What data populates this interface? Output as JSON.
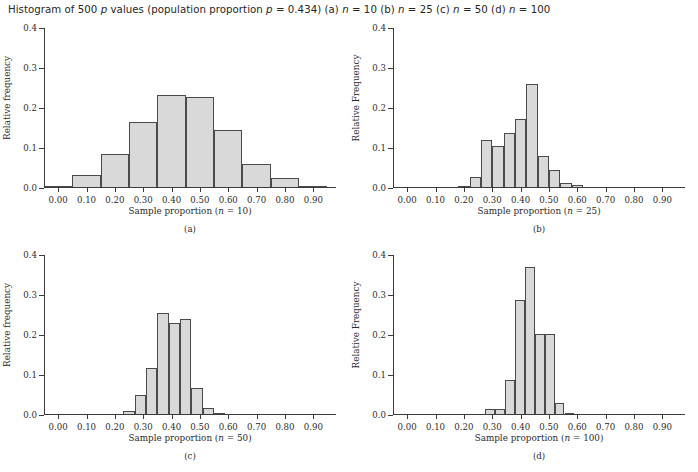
{
  "caption": {
    "prefix": "Histogram of 500 ",
    "phat": "p",
    "middle": " values (population proportion ",
    "p_sym": "p",
    "p_val": " = 0.434) (a) ",
    "n_a_sym": "n",
    "n_a": " = 10 (b) ",
    "n_b_sym": "n",
    "n_b": " = 25 (c) ",
    "n_c_sym": "n",
    "n_c": " = 50 (d) ",
    "n_d_sym": "n",
    "n_d": " = 100"
  },
  "style": {
    "bar_fill": "#d9d9d9",
    "bar_stroke": "#4a4a4a",
    "axis_color": "#3b3b3b",
    "text_color": "#2b2b2b",
    "background": "#ffffff"
  },
  "shared": {
    "x_ticks": [
      0.0,
      0.1,
      0.2,
      0.3,
      0.4,
      0.5,
      0.6,
      0.7,
      0.8,
      0.9
    ],
    "x_tick_labels": [
      "0.00",
      "0.10",
      "0.20",
      "0.30",
      "0.40",
      "0.50",
      "0.60",
      "0.70",
      "0.80",
      "0.90"
    ],
    "y_ticks": [
      0.0,
      0.1,
      0.2,
      0.3,
      0.4
    ],
    "y_tick_labels": [
      "0.0",
      "0.1",
      "0.2",
      "0.3",
      "0.4"
    ],
    "xlim": [
      -0.05,
      0.98
    ],
    "ylim": [
      0.0,
      0.4
    ],
    "xlabel_prefix": "Sample proportion (",
    "xlabel_n_sym": "n",
    "xlabel_suffix": ")"
  },
  "chart_data": [
    {
      "id": "a",
      "type": "bar",
      "subcaption": "(a)",
      "title": "",
      "xlabel": "Sample proportion (n = 10)",
      "xlabel_n_value": " = 10",
      "ylabel": "Relative frequency",
      "sample_size": 10,
      "xlim": [
        -0.05,
        0.98
      ],
      "ylim": [
        0.0,
        0.4
      ],
      "grid": false,
      "bin_width": 0.1,
      "bin_edges": [
        -0.05,
        0.05,
        0.15,
        0.25,
        0.35,
        0.45,
        0.55,
        0.65,
        0.75,
        0.85,
        0.95
      ],
      "centers": [
        0.0,
        0.1,
        0.2,
        0.3,
        0.4,
        0.5,
        0.6,
        0.7,
        0.8,
        0.9
      ],
      "values": [
        0.002,
        0.033,
        0.086,
        0.165,
        0.232,
        0.228,
        0.146,
        0.059,
        0.026,
        0.002
      ]
    },
    {
      "id": "b",
      "type": "bar",
      "subcaption": "(b)",
      "title": "",
      "xlabel": "Sample proportion (n = 25)",
      "xlabel_n_value": " = 25",
      "ylabel": "Relative Frequency",
      "sample_size": 25,
      "xlim": [
        -0.05,
        0.98
      ],
      "ylim": [
        0.0,
        0.4
      ],
      "grid": false,
      "bin_width": 0.04,
      "bin_edges": [
        0.18,
        0.22,
        0.26,
        0.3,
        0.34,
        0.38,
        0.42,
        0.46,
        0.5,
        0.54,
        0.58,
        0.62,
        0.66,
        0.7
      ],
      "centers": [
        0.2,
        0.24,
        0.28,
        0.32,
        0.36,
        0.4,
        0.44,
        0.48,
        0.52,
        0.56,
        0.6,
        0.64,
        0.68
      ],
      "values": [
        0.005,
        0.028,
        0.119,
        0.106,
        0.137,
        0.172,
        0.261,
        0.079,
        0.044,
        0.013,
        0.008,
        0.0,
        0.0
      ]
    },
    {
      "id": "c",
      "type": "bar",
      "subcaption": "(c)",
      "title": "",
      "xlabel": "Sample proportion (n = 50)",
      "xlabel_n_value": " = 50",
      "ylabel": "Relative frequency",
      "sample_size": 50,
      "xlim": [
        -0.05,
        0.98
      ],
      "ylim": [
        0.0,
        0.4
      ],
      "grid": false,
      "bin_width": 0.04,
      "bin_edges": [
        0.23,
        0.27,
        0.31,
        0.35,
        0.39,
        0.43,
        0.47,
        0.51,
        0.55,
        0.59,
        0.63
      ],
      "centers": [
        0.25,
        0.29,
        0.33,
        0.37,
        0.41,
        0.45,
        0.49,
        0.53,
        0.57,
        0.61
      ],
      "values": [
        0.01,
        0.049,
        0.118,
        0.254,
        0.231,
        0.241,
        0.067,
        0.018,
        0.003,
        0.0
      ]
    },
    {
      "id": "d",
      "type": "bar",
      "subcaption": "(d)",
      "title": "",
      "xlabel": "Sample proportion (n = 100)",
      "xlabel_n_value": " = 100",
      "ylabel": "Relative Frequency",
      "sample_size": 100,
      "xlim": [
        -0.05,
        0.98
      ],
      "ylim": [
        0.0,
        0.4
      ],
      "grid": false,
      "bin_width": 0.035,
      "bin_edges": [
        0.275,
        0.31,
        0.345,
        0.38,
        0.415,
        0.45,
        0.485,
        0.52,
        0.555,
        0.59,
        0.625
      ],
      "centers": [
        0.2925,
        0.3275,
        0.3625,
        0.3975,
        0.4325,
        0.4675,
        0.5025,
        0.5375,
        0.5725,
        0.6075
      ],
      "values": [
        0.016,
        0.016,
        0.087,
        0.288,
        0.37,
        0.202,
        0.202,
        0.031,
        0.003,
        0.0
      ]
    }
  ]
}
